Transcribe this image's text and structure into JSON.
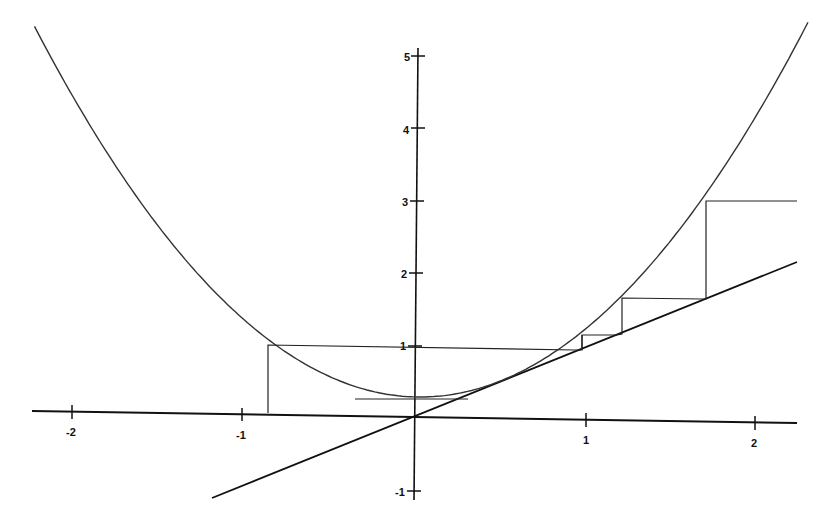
{
  "chart_data": {
    "type": "line",
    "title": "",
    "xlabel": "",
    "ylabel": "",
    "xlim": [
      -2.25,
      2.25
    ],
    "ylim": [
      -1.1,
      5.2
    ],
    "grid": false,
    "legend": null,
    "x_ticks": [
      "-2",
      "-1",
      "1",
      "2"
    ],
    "y_ticks": [
      "5",
      "4",
      "3",
      "2",
      "1",
      "-1"
    ],
    "series": [
      {
        "name": "parabola",
        "expression": "y = x^2 + 0.25",
        "x_range": [
          -2.25,
          2.3
        ]
      },
      {
        "name": "diagonal",
        "expression": "y = x",
        "x_range": [
          -1.2,
          2.25
        ]
      },
      {
        "name": "cobweb",
        "points": [
          [
            -0.86,
            0
          ],
          [
            -0.86,
            1.0
          ],
          [
            0.95,
            0.97
          ],
          [
            0.98,
            1.12
          ],
          [
            1.2,
            1.12
          ],
          [
            1.22,
            1.6
          ],
          [
            1.71,
            1.6
          ],
          [
            1.71,
            3.0
          ],
          [
            2.25,
            3.0
          ]
        ]
      }
    ],
    "annotations": []
  },
  "axes": {
    "x_labels": [
      {
        "text": "-2",
        "px": 71
      },
      {
        "text": "-1",
        "px": 242
      },
      {
        "text": "1",
        "px": 585
      },
      {
        "text": "2",
        "px": 755
      }
    ],
    "y_labels": [
      {
        "text": "5",
        "py": 57
      },
      {
        "text": "4",
        "py": 129
      },
      {
        "text": "3",
        "py": 201
      },
      {
        "text": "2",
        "py": 273
      },
      {
        "text": "1",
        "py": 345
      },
      {
        "text": "-1",
        "py": 490
      }
    ]
  },
  "colors": {
    "ink": "#111111",
    "background": "#ffffff"
  }
}
